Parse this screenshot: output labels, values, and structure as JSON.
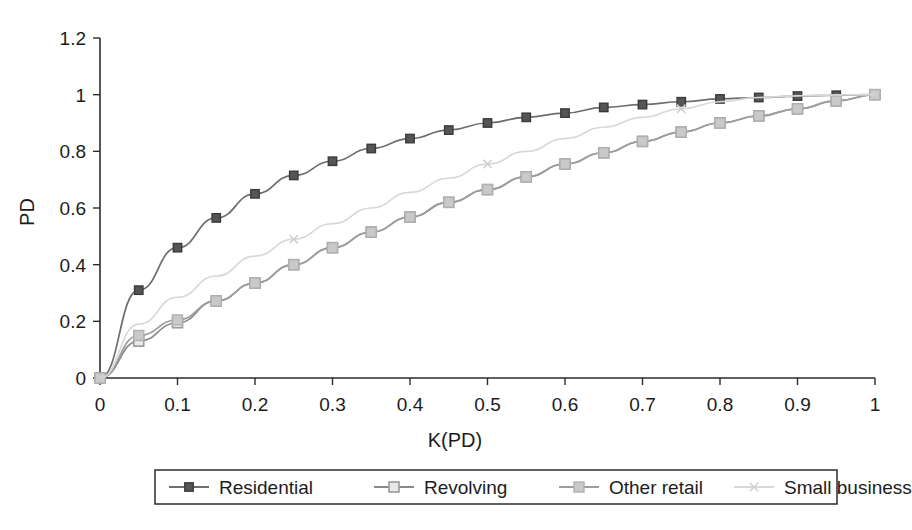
{
  "chart_data": {
    "type": "line",
    "title": "",
    "xlabel": "K(PD)",
    "ylabel": "PD",
    "xlim": [
      0,
      1
    ],
    "ylim": [
      0,
      1.2
    ],
    "xticks": [
      "0",
      "0.1",
      "0.2",
      "0.3",
      "0.4",
      "0.5",
      "0.6",
      "0.7",
      "0.8",
      "0.9",
      "1"
    ],
    "xtick_values": [
      0,
      0.1,
      0.2,
      0.3,
      0.4,
      0.5,
      0.6,
      0.7,
      0.8,
      0.9,
      1
    ],
    "yticks": [
      "0",
      "0.2",
      "0.4",
      "0.6",
      "0.8",
      "1",
      "1.2"
    ],
    "ytick_values": [
      0,
      0.2,
      0.4,
      0.6,
      0.8,
      1,
      1.2
    ],
    "grid": false,
    "legend_position": "bottom",
    "x": [
      0,
      0.05,
      0.1,
      0.15,
      0.2,
      0.25,
      0.3,
      0.35,
      0.4,
      0.45,
      0.5,
      0.55,
      0.6,
      0.65,
      0.7,
      0.75,
      0.8,
      0.85,
      0.9,
      0.95,
      1
    ],
    "series": [
      {
        "name": "Residential",
        "color": "#6e6e6e",
        "marker": "square-filled",
        "marker_color": "#4a4a4a",
        "values": [
          0,
          0.31,
          0.46,
          0.565,
          0.65,
          0.715,
          0.765,
          0.81,
          0.845,
          0.875,
          0.9,
          0.92,
          0.935,
          0.955,
          0.965,
          0.975,
          0.985,
          0.99,
          0.995,
          0.998,
          1
        ]
      },
      {
        "name": "Revolving",
        "color": "#8a8a8a",
        "marker": "square-open",
        "marker_color": "#9a9a9a",
        "values": [
          0,
          0.13,
          0.195,
          0.272,
          0.335,
          0.4,
          0.46,
          0.515,
          0.568,
          0.62,
          0.665,
          0.71,
          0.755,
          0.795,
          0.835,
          0.868,
          0.9,
          0.925,
          0.95,
          0.978,
          1
        ]
      },
      {
        "name": "Other retail",
        "color": "#9e9e9e",
        "marker": "square-light",
        "marker_color": "#b0b0b0",
        "values": [
          0,
          0.15,
          0.205,
          0.272,
          0.335,
          0.4,
          0.46,
          0.515,
          0.568,
          0.62,
          0.665,
          0.71,
          0.755,
          0.795,
          0.835,
          0.868,
          0.9,
          0.925,
          0.95,
          0.978,
          1
        ]
      },
      {
        "name": "Small business",
        "color": "#d8d8d8",
        "marker": "x-mark",
        "marker_color": "#cfcfcf",
        "values": [
          0,
          0.19,
          0.285,
          0.36,
          0.43,
          0.49,
          0.545,
          0.6,
          0.655,
          0.705,
          0.755,
          0.8,
          0.845,
          0.885,
          0.92,
          0.95,
          0.975,
          0.99,
          0.996,
          0.999,
          1
        ]
      }
    ]
  },
  "legend": {
    "items": [
      {
        "label": "Residential"
      },
      {
        "label": "Revolving"
      },
      {
        "label": "Other retail"
      },
      {
        "label": "Small business"
      }
    ]
  }
}
